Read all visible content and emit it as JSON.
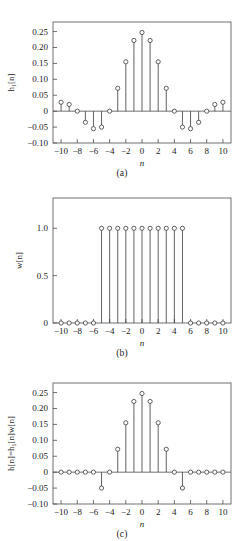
{
  "figure": {
    "type": "multi-panel-stem-plot",
    "panel_captions": [
      "(a)",
      "(b)",
      "(c)"
    ]
  },
  "chart_data": [
    {
      "type": "scatter",
      "subtype": "stem",
      "panel": "(a)",
      "title": "",
      "xlabel": "n",
      "ylabel": "h₁[n]",
      "x": [
        -10,
        -9,
        -8,
        -7,
        -6,
        -5,
        -4,
        -3,
        -2,
        -1,
        0,
        1,
        2,
        3,
        4,
        5,
        6,
        7,
        8,
        9,
        10
      ],
      "values": [
        0.028,
        0.021,
        0.0,
        -0.035,
        -0.055,
        -0.05,
        0.0,
        0.072,
        0.155,
        0.222,
        0.247,
        0.222,
        0.155,
        0.072,
        0.0,
        -0.05,
        -0.055,
        -0.035,
        0.0,
        0.021,
        0.028
      ],
      "xlim": [
        -11,
        11
      ],
      "ylim": [
        -0.1,
        0.28
      ],
      "xticks": [
        -10,
        -8,
        -6,
        -4,
        -2,
        0,
        2,
        4,
        6,
        8,
        10
      ],
      "xticklabels": [
        "−10",
        "−8",
        "−6",
        "−4",
        "−2",
        "0",
        "2",
        "4",
        "6",
        "8",
        "10"
      ],
      "yticks": [
        -0.1,
        -0.05,
        0,
        0.05,
        0.1,
        0.15,
        0.2,
        0.25
      ],
      "yticklabels": [
        "−0.10",
        "−0.05",
        "0",
        "0.05",
        "0.10",
        "0.15",
        "0.20",
        "0.25"
      ],
      "grid": false,
      "legend": "none"
    },
    {
      "type": "scatter",
      "subtype": "stem",
      "panel": "(b)",
      "title": "",
      "xlabel": "n",
      "ylabel": "w[n]",
      "x": [
        -10,
        -9,
        -8,
        -7,
        -6,
        -5,
        -4,
        -3,
        -2,
        -1,
        0,
        1,
        2,
        3,
        4,
        5,
        6,
        7,
        8,
        9,
        10
      ],
      "values": [
        0,
        0,
        0,
        0,
        0,
        1,
        1,
        1,
        1,
        1,
        1,
        1,
        1,
        1,
        1,
        1,
        0,
        0,
        0,
        0,
        0
      ],
      "xlim": [
        -11,
        11
      ],
      "ylim": [
        0,
        1.32
      ],
      "xticks": [
        -10,
        -8,
        -6,
        -4,
        -2,
        0,
        2,
        4,
        6,
        8,
        10
      ],
      "xticklabels": [
        "−10",
        "−8",
        "−6",
        "−4",
        "−2",
        "0",
        "2",
        "4",
        "6",
        "8",
        "10"
      ],
      "yticks": [
        0,
        0.5,
        1.0
      ],
      "yticklabels": [
        "0",
        "0.5",
        "1.0"
      ],
      "grid": false,
      "legend": "none"
    },
    {
      "type": "scatter",
      "subtype": "stem",
      "panel": "(c)",
      "title": "",
      "xlabel": "n",
      "ylabel": "h[n]=h₁[n]w[n]",
      "x": [
        -10,
        -9,
        -8,
        -7,
        -6,
        -5,
        -4,
        -3,
        -2,
        -1,
        0,
        1,
        2,
        3,
        4,
        5,
        6,
        7,
        8,
        9,
        10
      ],
      "values": [
        0,
        0,
        0,
        0,
        0,
        -0.05,
        0.0,
        0.072,
        0.155,
        0.222,
        0.247,
        0.222,
        0.155,
        0.072,
        0.0,
        -0.05,
        0,
        0,
        0,
        0,
        0
      ],
      "xlim": [
        -11,
        11
      ],
      "ylim": [
        -0.1,
        0.28
      ],
      "xticks": [
        -10,
        -8,
        -6,
        -4,
        -2,
        0,
        2,
        4,
        6,
        8,
        10
      ],
      "xticklabels": [
        "−10",
        "−8",
        "−6",
        "−4",
        "−2",
        "0",
        "2",
        "4",
        "6",
        "8",
        "10"
      ],
      "yticks": [
        -0.1,
        -0.05,
        0,
        0.05,
        0.1,
        0.15,
        0.2,
        0.25
      ],
      "yticklabels": [
        "−0.10",
        "−0.05",
        "0",
        "0.05",
        "0.10",
        "0.15",
        "0.20",
        "0.25"
      ],
      "grid": false,
      "legend": "none"
    }
  ],
  "colors": {
    "stem": "#3a3a3a",
    "marker_fill": "#ffffff",
    "axis": "#4d4d4d",
    "text": "#1a1a1a",
    "background": "#ffffff"
  }
}
